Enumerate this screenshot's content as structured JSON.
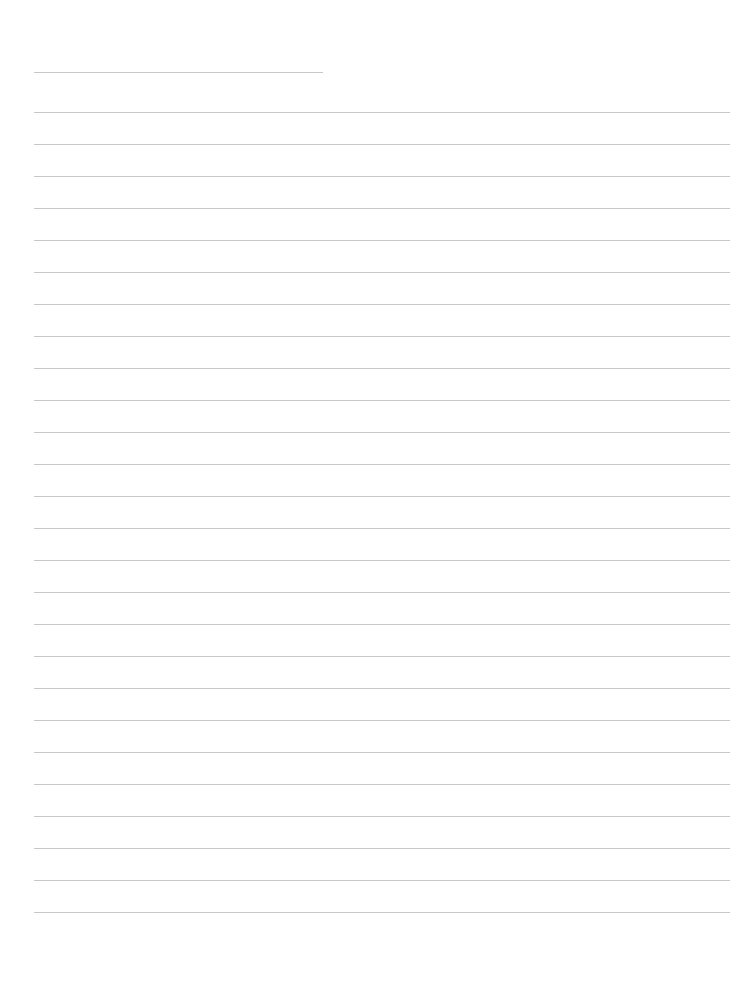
{
  "page": {
    "type": "lined-paper",
    "background_color": "#ffffff",
    "rule_color": "#bdbdbd",
    "header_line": {
      "y": 72,
      "x_start": 34,
      "x_end": 323
    },
    "lines": {
      "count": 26,
      "first_y": 112,
      "spacing": 32,
      "x_start": 34,
      "x_end": 730
    },
    "written_text": []
  }
}
